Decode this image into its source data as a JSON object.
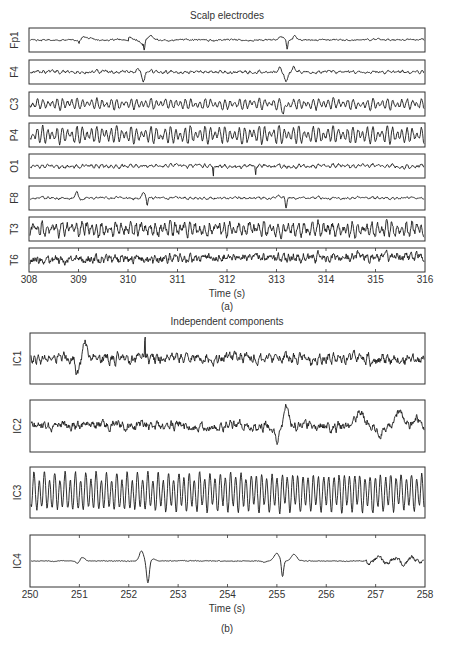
{
  "chart_data": [
    {
      "type": "line",
      "panel_label": "(a)",
      "title": "Scalp electrodes",
      "xlabel": "Time (s)",
      "ylabel": "",
      "xlim": [
        308,
        316
      ],
      "x_ticks": [
        308,
        309,
        310,
        311,
        312,
        313,
        314,
        315,
        316
      ],
      "grid": false,
      "legend": "none",
      "series": [
        {
          "name": "Fp1",
          "description": "EEG with large eye-blink artifacts (sharp deflections) near 310.3 s and 313.2 s, smaller slow waves near 309.0 s"
        },
        {
          "name": "F4",
          "description": "EEG with blink artifacts near 310.3 s and 313.2 s"
        },
        {
          "name": "C3",
          "description": "Rhythmic alpha-like activity, small dip near 313.2 s"
        },
        {
          "name": "P4",
          "description": "Rhythmic alpha-like activity"
        },
        {
          "name": "O1",
          "description": "Low-amplitude activity with brief spikes near 311.7 s and 312.6 s"
        },
        {
          "name": "F8",
          "description": "EEG with lateral eye-movement artifacts near 309.0 s, 310.3 s and 313.2 s"
        },
        {
          "name": "T3",
          "description": "Low-amplitude activity"
        },
        {
          "name": "T6",
          "description": "Low-amplitude high-frequency activity"
        }
      ]
    },
    {
      "type": "line",
      "panel_label": "(b)",
      "title": "Independent components",
      "xlabel": "Time (s)",
      "ylabel": "",
      "xlim": [
        250,
        258
      ],
      "x_ticks": [
        250,
        251,
        252,
        253,
        254,
        255,
        256,
        257,
        258
      ],
      "grid": false,
      "legend": "none",
      "series": [
        {
          "name": "IC1",
          "description": "Component with deflection near 251.0 s and spike near 252.3 s"
        },
        {
          "name": "IC2",
          "description": "Noisy component with peaks near 255.2 s, 256.7 s and 257.5 s"
        },
        {
          "name": "IC3",
          "description": "Rhythmic oscillatory component (alpha rhythm)"
        },
        {
          "name": "IC4",
          "description": "Eye-blink artifact component with large spikes near 252.3 s and 255.1 s, small deflection near 251.0 s"
        }
      ]
    }
  ],
  "panel_a": {
    "title": "Scalp electrodes",
    "channels": [
      "Fp1",
      "F4",
      "C3",
      "P4",
      "O1",
      "F8",
      "T3",
      "T6"
    ],
    "x_ticks": [
      "308",
      "309",
      "310",
      "311",
      "312",
      "313",
      "314",
      "315",
      "316"
    ],
    "xlabel": "Time (s)",
    "label": "(a)"
  },
  "panel_b": {
    "title": "Independent components",
    "channels": [
      "IC1",
      "IC2",
      "IC3",
      "IC4"
    ],
    "x_ticks": [
      "250",
      "251",
      "252",
      "253",
      "254",
      "255",
      "256",
      "257",
      "258"
    ],
    "xlabel": "Time (s)",
    "label": "(b)"
  },
  "colors": {
    "trace": "#1a1a1a",
    "axis": "#333333",
    "background": "#ffffff"
  }
}
